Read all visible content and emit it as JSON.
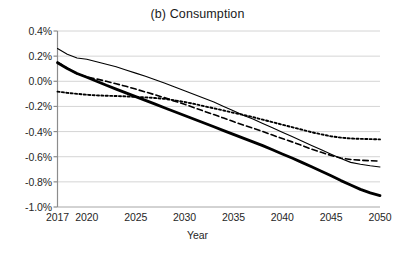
{
  "chart_data": {
    "type": "line",
    "title": "(b) Consumption",
    "xlabel": "Year",
    "ylabel": "",
    "xlim": [
      2017,
      2050
    ],
    "ylim": [
      -1.0,
      0.4
    ],
    "grid": true,
    "legend": "none",
    "y_tick_labels": [
      "0.4%",
      "0.2%",
      "0.0%",
      "-0.2%",
      "-0.4%",
      "-0.6%",
      "-0.8%",
      "-1.0%"
    ],
    "y_tick_values": [
      0.4,
      0.2,
      0.0,
      -0.2,
      -0.4,
      -0.6,
      -0.8,
      -1.0
    ],
    "x_tick_labels": [
      "2017",
      "2020",
      "2025",
      "2030",
      "2035",
      "2040",
      "2045",
      "2050"
    ],
    "x_tick_values": [
      2017,
      2020,
      2025,
      2030,
      2035,
      2040,
      2045,
      2050
    ],
    "x": [
      2017,
      2018,
      2019,
      2020,
      2021,
      2022,
      2023,
      2024,
      2025,
      2026,
      2027,
      2028,
      2029,
      2030,
      2031,
      2032,
      2033,
      2034,
      2035,
      2036,
      2037,
      2038,
      2039,
      2040,
      2041,
      2042,
      2043,
      2044,
      2045,
      2046,
      2047,
      2048,
      2049,
      2050
    ],
    "series": [
      {
        "name": "thin-solid",
        "style": "solid",
        "width": 1.1,
        "color": "#000000",
        "values": [
          0.26,
          0.215,
          0.185,
          0.175,
          0.155,
          0.135,
          0.115,
          0.09,
          0.065,
          0.04,
          0.013,
          -0.015,
          -0.045,
          -0.075,
          -0.105,
          -0.135,
          -0.165,
          -0.2,
          -0.235,
          -0.27,
          -0.3,
          -0.335,
          -0.37,
          -0.405,
          -0.44,
          -0.475,
          -0.51,
          -0.545,
          -0.58,
          -0.615,
          -0.645,
          -0.66,
          -0.672,
          -0.682
        ]
      },
      {
        "name": "dashed",
        "style": "dashed",
        "width": 1.6,
        "color": "#000000",
        "values": [
          0.152,
          0.105,
          0.06,
          0.035,
          0.018,
          0.0,
          -0.02,
          -0.04,
          -0.062,
          -0.085,
          -0.108,
          -0.132,
          -0.158,
          -0.183,
          -0.21,
          -0.238,
          -0.265,
          -0.293,
          -0.32,
          -0.348,
          -0.372,
          -0.4,
          -0.428,
          -0.455,
          -0.482,
          -0.51,
          -0.54,
          -0.565,
          -0.59,
          -0.61,
          -0.622,
          -0.628,
          -0.632,
          -0.635
        ]
      },
      {
        "name": "dotted",
        "style": "dotted",
        "width": 1.9,
        "color": "#000000",
        "values": [
          -0.082,
          -0.092,
          -0.1,
          -0.107,
          -0.112,
          -0.115,
          -0.117,
          -0.12,
          -0.125,
          -0.128,
          -0.133,
          -0.14,
          -0.152,
          -0.165,
          -0.18,
          -0.198,
          -0.215,
          -0.232,
          -0.25,
          -0.267,
          -0.285,
          -0.305,
          -0.325,
          -0.345,
          -0.365,
          -0.385,
          -0.405,
          -0.422,
          -0.438,
          -0.448,
          -0.455,
          -0.458,
          -0.46,
          -0.462
        ]
      },
      {
        "name": "thick-solid",
        "style": "solid",
        "width": 2.8,
        "color": "#000000",
        "values": [
          0.148,
          0.102,
          0.062,
          0.032,
          0.0,
          -0.032,
          -0.062,
          -0.092,
          -0.122,
          -0.152,
          -0.182,
          -0.212,
          -0.242,
          -0.272,
          -0.302,
          -0.332,
          -0.362,
          -0.392,
          -0.422,
          -0.452,
          -0.482,
          -0.512,
          -0.545,
          -0.578,
          -0.61,
          -0.645,
          -0.68,
          -0.715,
          -0.752,
          -0.79,
          -0.825,
          -0.86,
          -0.888,
          -0.91
        ]
      }
    ]
  },
  "axes": {
    "title_text": "(b) Consumption",
    "x_axis_title": "Year"
  }
}
